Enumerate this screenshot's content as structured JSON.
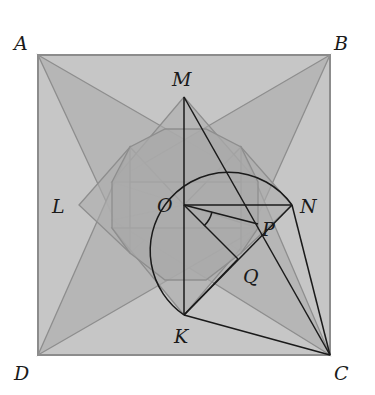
{
  "diagram": {
    "type": "geometry-figure",
    "colors": {
      "background": "#ffffff",
      "square_fill": "#c6c6c6",
      "square_stroke": "#8c8c8c",
      "kite_fill": "#b3b3b3",
      "dodecagon_fill": "#a9a9a9",
      "light_line": "#8e8e8e",
      "dark_line": "#1a1a1a"
    },
    "points": {
      "A": {
        "label": "A",
        "x": 38,
        "y": 55
      },
      "B": {
        "label": "B",
        "x": 330,
        "y": 55
      },
      "C": {
        "label": "C",
        "x": 330,
        "y": 355
      },
      "D": {
        "label": "D",
        "x": 38,
        "y": 355
      },
      "M": {
        "label": "M",
        "x": 184,
        "y": 97
      },
      "O": {
        "label": "O",
        "x": 184,
        "y": 205
      },
      "N": {
        "label": "N",
        "x": 292,
        "y": 205
      },
      "K": {
        "label": "K",
        "x": 184,
        "y": 315
      },
      "L": {
        "label": "L",
        "x": 79,
        "y": 205
      },
      "P": {
        "label": "P",
        "x": 258,
        "y": 224
      },
      "Q": {
        "label": "Q",
        "x": 238,
        "y": 259
      }
    },
    "segments_dark": [
      "MO",
      "OK",
      "ON",
      "MC",
      "NC",
      "KC",
      "KN",
      "OP",
      "OQ",
      "NP"
    ],
    "arc": {
      "center": "O-ish",
      "from": "K",
      "to": "N",
      "description": "arc from K sweeping left/up through top to N"
    },
    "angle_mark": {
      "at": "O",
      "between": [
        "OP",
        "OQ"
      ]
    }
  }
}
